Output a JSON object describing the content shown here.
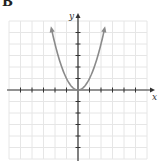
{
  "panel": {
    "label": "B"
  },
  "chart_data": {
    "type": "line",
    "title": "",
    "function": "y = x^2",
    "xlabel": "x",
    "ylabel": "y",
    "xlim": [
      -6,
      6
    ],
    "ylim": [
      -6,
      6
    ],
    "grid": true,
    "tick_step": 1,
    "tick_labels": [],
    "series": [
      {
        "name": "parabola",
        "color": "#8a8a8a",
        "arrows_at_ends": true,
        "x": [
          -2.3,
          -2,
          -1.5,
          -1,
          -0.5,
          0,
          0.5,
          1,
          1.5,
          2,
          2.3
        ],
        "y": [
          5.29,
          4,
          2.25,
          1,
          0.25,
          0,
          0.25,
          1,
          2.25,
          4,
          5.29
        ]
      }
    ],
    "legend": null
  },
  "style": {
    "axis_color": "#333333",
    "grid_color": "#e6e6e6",
    "curve_color": "#8a8a8a"
  }
}
